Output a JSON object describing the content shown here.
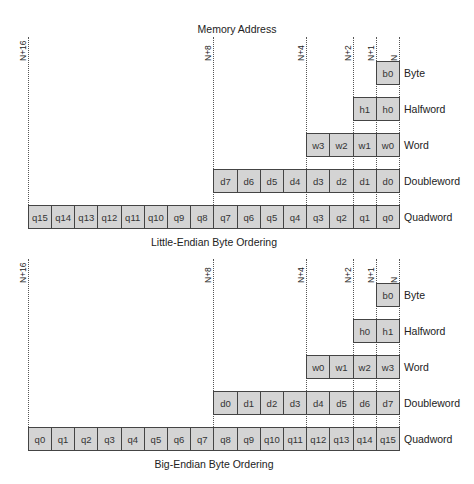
{
  "header": {
    "title": "Memory Address"
  },
  "address_markers": [
    "N+16",
    "N+8",
    "N+4",
    "N+2",
    "N+1",
    "N"
  ],
  "row_labels": [
    "Byte",
    "Halfword",
    "Word",
    "Doubleword",
    "Quadword"
  ],
  "little_endian": {
    "caption": "Little-Endian Byte Ordering",
    "rows": [
      {
        "label": "Byte",
        "cells": [
          "b0"
        ]
      },
      {
        "label": "Halfword",
        "cells": [
          "h1",
          "h0"
        ]
      },
      {
        "label": "Word",
        "cells": [
          "w3",
          "w2",
          "w1",
          "w0"
        ]
      },
      {
        "label": "Doubleword",
        "cells": [
          "d7",
          "d6",
          "d5",
          "d4",
          "d3",
          "d2",
          "d1",
          "d0"
        ]
      },
      {
        "label": "Quadword",
        "cells": [
          "q15",
          "q14",
          "q13",
          "q12",
          "q11",
          "q10",
          "q9",
          "q8",
          "q7",
          "q6",
          "q5",
          "q4",
          "q3",
          "q2",
          "q1",
          "q0"
        ]
      }
    ]
  },
  "big_endian": {
    "caption": "Big-Endian Byte Ordering",
    "rows": [
      {
        "label": "Byte",
        "cells": [
          "b0"
        ]
      },
      {
        "label": "Halfword",
        "cells": [
          "h0",
          "h1"
        ]
      },
      {
        "label": "Word",
        "cells": [
          "w0",
          "w1",
          "w2",
          "w3"
        ]
      },
      {
        "label": "Doubleword",
        "cells": [
          "d0",
          "d1",
          "d2",
          "d3",
          "d4",
          "d5",
          "d6",
          "d7"
        ]
      },
      {
        "label": "Quadword",
        "cells": [
          "q0",
          "q1",
          "q2",
          "q3",
          "q4",
          "q5",
          "q6",
          "q7",
          "q8",
          "q9",
          "q10",
          "q11",
          "q12",
          "q13",
          "q14",
          "q15"
        ]
      }
    ]
  },
  "colors": {
    "cell_fill": "#d4d4d4",
    "cell_border": "#444444",
    "guide_line": "#555555"
  }
}
